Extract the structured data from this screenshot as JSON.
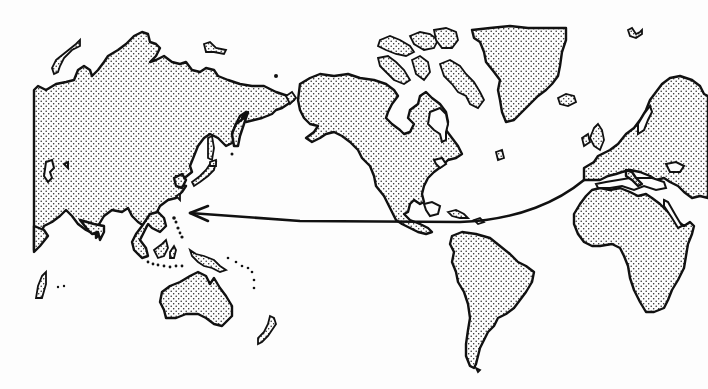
{
  "map": {
    "type": "world-map-illustration",
    "style": "black outline with stippled land",
    "colors": {
      "outline": "#111111",
      "stipple": "#222222",
      "background": "#fdfdfd"
    },
    "regions": [
      {
        "name": "asia",
        "label": ""
      },
      {
        "name": "north-america",
        "label": ""
      },
      {
        "name": "greenland",
        "label": ""
      },
      {
        "name": "south-america",
        "label": ""
      },
      {
        "name": "europe",
        "label": ""
      },
      {
        "name": "africa",
        "label": ""
      },
      {
        "name": "australia",
        "label": ""
      },
      {
        "name": "new-zealand",
        "label": ""
      },
      {
        "name": "madagascar",
        "label": ""
      },
      {
        "name": "japan",
        "label": ""
      },
      {
        "name": "philippines",
        "label": ""
      },
      {
        "name": "indonesia",
        "label": ""
      },
      {
        "name": "new-guinea",
        "label": ""
      }
    ],
    "route": {
      "description": "Route from Iberian Peninsula across the Atlantic to Central America, then across the Pacific to the Philippines, ending in an arrowhead",
      "start": [
        584,
        180
      ],
      "via": [
        450,
        222
      ],
      "end": [
        190,
        213
      ],
      "direction": "westward"
    }
  }
}
